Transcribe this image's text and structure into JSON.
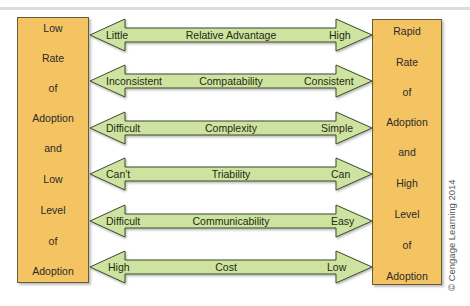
{
  "left_box": {
    "words": [
      "Low",
      "Rate",
      "of",
      "Adoption",
      "and",
      "Low",
      "Level",
      "of",
      "Adoption"
    ]
  },
  "right_box": {
    "words": [
      "Rapid",
      "Rate",
      "of",
      "Adoption",
      "and",
      "High",
      "Level",
      "of",
      "Adoption"
    ]
  },
  "arrows": [
    {
      "left": "Little",
      "center": "Relative Advantage",
      "right": "High"
    },
    {
      "left": "Inconsistent",
      "center": "Compatability",
      "right": "Consistent"
    },
    {
      "left": "Difficult",
      "center": "Complexity",
      "right": "Simple"
    },
    {
      "left": "Can't",
      "center": "Triability",
      "right": "Can"
    },
    {
      "left": "Difficult",
      "center": "Communicability",
      "right": "Easy"
    },
    {
      "left": "High",
      "center": "Cost",
      "right": "Low"
    }
  ],
  "colors": {
    "box_fill": "#f5c462",
    "arrow_fill": "#cfe3a0",
    "outline": "#3b4a2a"
  },
  "copyright": "© Cengage Learning 2014"
}
